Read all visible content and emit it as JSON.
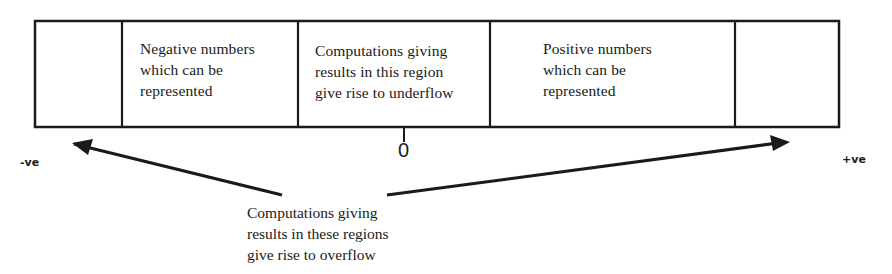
{
  "diagram": {
    "type": "number-line-regions",
    "cells": [
      {
        "id": "overflow-negative",
        "text": ""
      },
      {
        "id": "negative-representable",
        "text": "Negative numbers\nwhich can be\nrepresented"
      },
      {
        "id": "underflow",
        "text": "Computations giving\nresults in this region\ngive rise to underflow"
      },
      {
        "id": "positive-representable",
        "text": "Positive numbers\nwhich can be\nrepresented"
      },
      {
        "id": "overflow-positive",
        "text": ""
      }
    ],
    "zero_label": "0",
    "negative_label": "-ve",
    "positive_label": "+ve",
    "overflow_caption": "Computations giving\nresults in these regions\ngive rise to overflow",
    "colors": {
      "line": "#1a1a1a",
      "background": "#ffffff"
    }
  }
}
